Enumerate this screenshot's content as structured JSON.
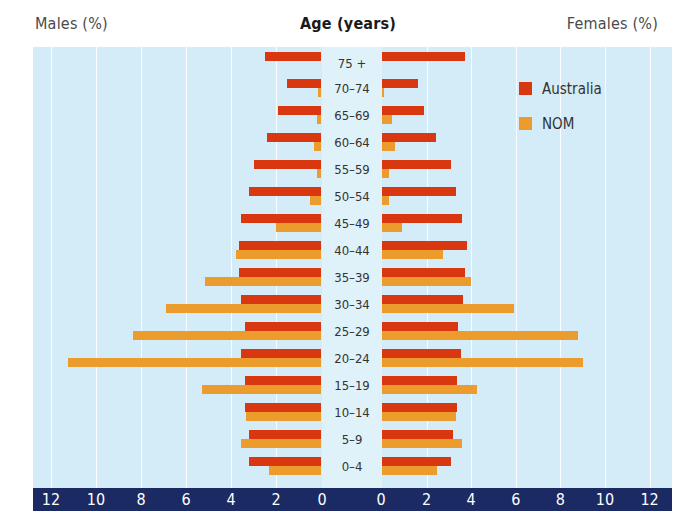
{
  "header": {
    "left_label": "Males (%)",
    "center_label": "Age (years)",
    "right_label": "Females (%)"
  },
  "legend": [
    {
      "label": "Australia",
      "color": "#d9370f"
    },
    {
      "label": "NOM",
      "color": "#eb9c2c"
    }
  ],
  "axis": {
    "left_ticks": [
      "12",
      "10",
      "8",
      "6",
      "4",
      "2",
      "0"
    ],
    "right_ticks": [
      "0",
      "2",
      "4",
      "6",
      "8",
      "10",
      "12"
    ]
  },
  "chart_data": {
    "type": "bar",
    "subtype": "population-pyramid",
    "title": "",
    "xlabel_left": "Males (%)",
    "xlabel_right": "Females (%)",
    "ylabel": "Age (years)",
    "xlim": [
      0,
      12
    ],
    "grid": true,
    "legend_position": "upper right",
    "categories": [
      "75 +",
      "70–74",
      "65–69",
      "60–64",
      "55–59",
      "50–54",
      "45–49",
      "40–44",
      "35–39",
      "30–34",
      "25–29",
      "20–24",
      "15–19",
      "10–14",
      "5–9",
      "0–4"
    ],
    "series": [
      {
        "name": "Australia",
        "sex": "Males",
        "color": "#d9370f",
        "values": [
          2.5,
          1.5,
          1.9,
          2.4,
          3.0,
          3.2,
          3.55,
          3.65,
          3.65,
          3.55,
          3.4,
          3.55,
          3.4,
          3.4,
          3.2,
          3.2
        ]
      },
      {
        "name": "NOM",
        "sex": "Males",
        "color": "#eb9c2c",
        "values": [
          0.0,
          0.15,
          0.2,
          0.3,
          0.2,
          0.5,
          2.0,
          3.8,
          5.15,
          6.9,
          8.35,
          11.25,
          5.3,
          3.35,
          3.55,
          2.3
        ]
      },
      {
        "name": "Australia",
        "sex": "Females",
        "color": "#d9370f",
        "values": [
          3.7,
          1.6,
          1.9,
          2.4,
          3.1,
          3.3,
          3.6,
          3.8,
          3.7,
          3.65,
          3.4,
          3.55,
          3.35,
          3.35,
          3.2,
          3.1
        ]
      },
      {
        "name": "NOM",
        "sex": "Females",
        "color": "#eb9c2c",
        "values": [
          0.0,
          0.1,
          0.45,
          0.6,
          0.3,
          0.3,
          0.9,
          2.75,
          4.0,
          5.9,
          8.8,
          9.0,
          4.25,
          3.3,
          3.6,
          2.45
        ]
      }
    ]
  }
}
